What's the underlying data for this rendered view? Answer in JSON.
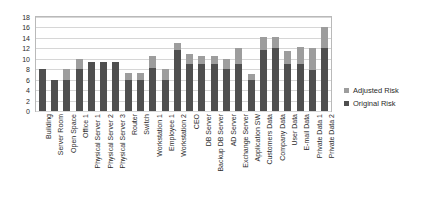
{
  "chart_data": {
    "type": "bar",
    "stacked": true,
    "title": "",
    "xlabel": "",
    "ylabel": "",
    "ylim": [
      0,
      18
    ],
    "ytick_step": 2,
    "yticks": [
      0,
      2,
      4,
      6,
      8,
      10,
      12,
      14,
      16,
      18
    ],
    "grid": true,
    "legend_position": "right",
    "categories": [
      "Building",
      "Server Room",
      "Open Space",
      "Office 1",
      "Physical Server 1",
      "Physical Server 2",
      "Physical Server 3",
      "Router",
      "Switch",
      "Workstation 1",
      "Employee 1",
      "Workstation 2",
      "CEO",
      "DB Server",
      "Backup DB Server",
      "AD Server",
      "Exchange Server",
      "Application SW",
      "Customers Data",
      "Company Data",
      "User Data",
      "E-mail Data",
      "Private Data 1",
      "Private Data 2"
    ],
    "series": [
      {
        "name": "Original Risk",
        "color": "#4f4f4f",
        "values": [
          8,
          5.9,
          6,
          8,
          9.3,
          9.3,
          9.3,
          6,
          6,
          8.3,
          6,
          11.7,
          9,
          9,
          9,
          8,
          9,
          6,
          11.7,
          12,
          9,
          9,
          7.8,
          12
        ]
      },
      {
        "name": "Adjusted Risk",
        "color": "#9d9d9d",
        "values": [
          0,
          0,
          2,
          2,
          0,
          0,
          0,
          1.3,
          1.3,
          2.2,
          2,
          1.3,
          2,
          1.6,
          1.6,
          2,
          3,
          1,
          2.4,
          2.1,
          2.5,
          3.3,
          4.2,
          4
        ]
      }
    ],
    "totals": [
      8,
      5.9,
      8,
      10,
      9.3,
      9.3,
      9.3,
      7.3,
      7.3,
      10.5,
      8,
      13,
      11,
      10.6,
      10.6,
      10,
      12,
      7,
      14.1,
      14.1,
      11.5,
      12.3,
      12,
      16
    ]
  },
  "legend": {
    "entries": [
      {
        "label": "Adjusted Risk",
        "color": "#9d9d9d"
      },
      {
        "label": "Original Risk",
        "color": "#4f4f4f"
      }
    ]
  }
}
